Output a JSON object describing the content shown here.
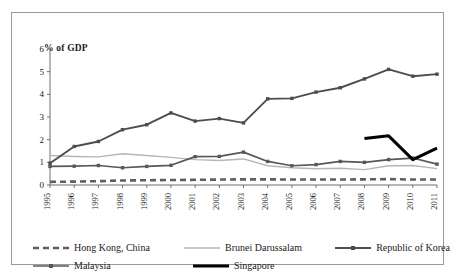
{
  "chart_data": {
    "type": "line",
    "title": "",
    "xlabel": "",
    "ylabel": "% of GDP",
    "ylim": [
      0,
      6
    ],
    "yticks": [
      0,
      1,
      2,
      3,
      4,
      5,
      6
    ],
    "grid": false,
    "legend_position": "bottom",
    "categories": [
      "1995",
      "1996",
      "1997",
      "1998",
      "1999",
      "2000",
      "2001",
      "2002",
      "2003",
      "2004",
      "2005",
      "2006",
      "2007",
      "2008",
      "2009",
      "2010",
      "2011"
    ],
    "series": [
      {
        "name": "Hong Kong, China",
        "style": "dashed",
        "color": "#5e5e5e",
        "width": 2.6,
        "marker": "none",
        "values": [
          0.14,
          0.15,
          0.17,
          0.2,
          0.21,
          0.22,
          0.23,
          0.24,
          0.25,
          0.25,
          0.24,
          0.24,
          0.24,
          0.25,
          0.26,
          0.24,
          0.24
        ]
      },
      {
        "name": "Brunei Darussalam",
        "style": "solid",
        "color": "#b6b6b6",
        "width": 1.4,
        "marker": "none",
        "values": [
          1.3,
          1.26,
          1.24,
          1.38,
          1.3,
          1.22,
          1.12,
          1.08,
          1.15,
          0.85,
          0.76,
          0.72,
          0.74,
          0.68,
          0.85,
          0.86,
          0.72
        ]
      },
      {
        "name": "Republic of Korea",
        "style": "solid",
        "color": "#4d4d4d",
        "width": 1.9,
        "marker": "square",
        "values": [
          0.96,
          1.7,
          1.92,
          2.44,
          2.66,
          3.18,
          2.82,
          2.93,
          2.74,
          3.8,
          3.82,
          4.1,
          4.29,
          4.68,
          5.1,
          4.8,
          4.89
        ]
      },
      {
        "name": "Malaysia",
        "style": "solid",
        "color": "#585858",
        "width": 1.7,
        "marker": "square",
        "values": [
          0.82,
          0.83,
          0.86,
          0.76,
          0.82,
          0.87,
          1.25,
          1.26,
          1.45,
          1.04,
          0.85,
          0.9,
          1.04,
          1.0,
          1.12,
          1.19,
          0.92
        ]
      },
      {
        "name": "Singapore",
        "style": "solid",
        "color": "#000000",
        "width": 3.0,
        "marker": "none",
        "start_index": 13,
        "values": [
          null,
          null,
          null,
          null,
          null,
          null,
          null,
          null,
          null,
          null,
          null,
          null,
          null,
          2.05,
          2.17,
          1.12,
          1.63
        ]
      }
    ]
  },
  "legend": {
    "items": [
      {
        "label": "Hong Kong, China"
      },
      {
        "label": "Brunei Darussalam"
      },
      {
        "label": "Republic of Korea"
      },
      {
        "label": "Malaysia"
      },
      {
        "label": "Singapore"
      }
    ]
  }
}
